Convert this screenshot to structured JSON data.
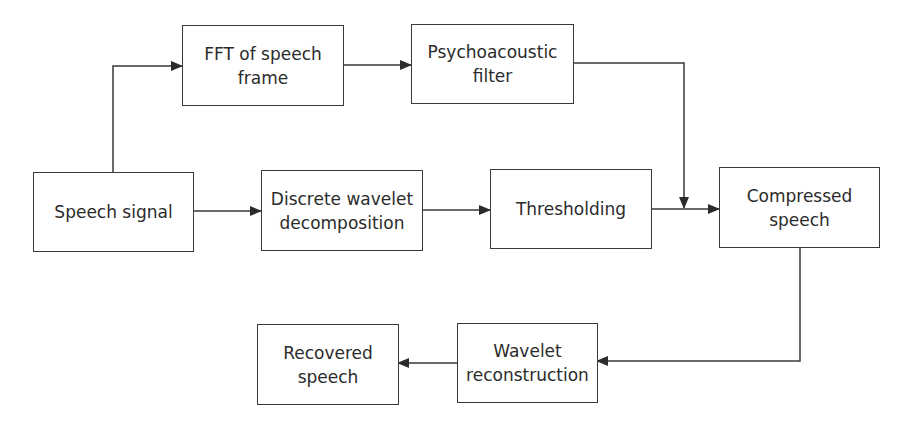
{
  "diagram": {
    "nodes": [
      {
        "id": "speech_signal",
        "label": "Speech signal"
      },
      {
        "id": "fft",
        "label": "FFT of speech\nframe"
      },
      {
        "id": "psycho",
        "label": "Psychoacoustic\nfilter"
      },
      {
        "id": "dwt",
        "label": "Discrete wavelet\ndecomposition"
      },
      {
        "id": "threshold",
        "label": "Thresholding"
      },
      {
        "id": "compressed",
        "label": "Compressed\nspeech"
      },
      {
        "id": "wavelet_recon",
        "label": "Wavelet\nreconstruction"
      },
      {
        "id": "recovered",
        "label": "Recovered\nspeech"
      }
    ],
    "edges": [
      {
        "from": "speech_signal",
        "to": "fft"
      },
      {
        "from": "fft",
        "to": "psycho"
      },
      {
        "from": "psycho",
        "to": "compressed_junction"
      },
      {
        "from": "speech_signal",
        "to": "dwt"
      },
      {
        "from": "dwt",
        "to": "threshold"
      },
      {
        "from": "threshold",
        "to": "compressed"
      },
      {
        "from": "compressed",
        "to": "wavelet_recon"
      },
      {
        "from": "wavelet_recon",
        "to": "recovered"
      }
    ],
    "colors": {
      "line": "#3a3a3a",
      "text": "#2b2b2b",
      "background": "#ffffff"
    }
  }
}
